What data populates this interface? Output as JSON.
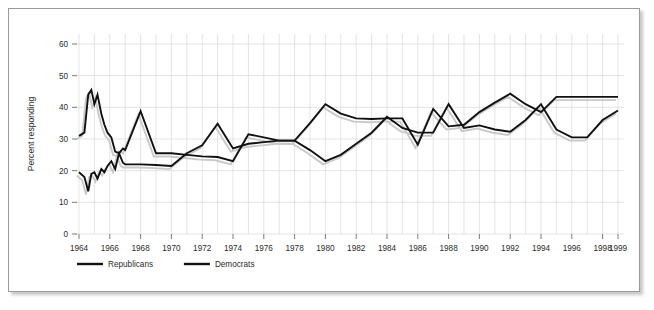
{
  "figure": {
    "frame_border_color": "#9a9a9a",
    "background_color": "#ffffff",
    "line_color": "#111111",
    "shadow_color": "#c9c9c9",
    "grid_color": "#d8d8d8"
  },
  "axis": {
    "y_title": "Percent responding",
    "y_ticks": [
      "0",
      "10",
      "20",
      "30",
      "40",
      "50",
      "60"
    ],
    "x_ticks": [
      "1964",
      "1966",
      "1968",
      "1970",
      "1972",
      "1974",
      "1976",
      "1978",
      "1980",
      "1982",
      "1984",
      "1986",
      "1988",
      "1990",
      "1992",
      "1994",
      "1996",
      "1998",
      "1999"
    ]
  },
  "legend": {
    "items": [
      {
        "label": "Republicans",
        "color": "#111111"
      },
      {
        "label": "Democrats",
        "color": "#111111"
      }
    ]
  },
  "chart_data": {
    "type": "line",
    "title": "",
    "xlabel": "",
    "ylabel": "Percent responding",
    "xlim": [
      1964,
      1999
    ],
    "ylim": [
      0,
      65
    ],
    "y_ticks": [
      0,
      10,
      20,
      30,
      40,
      50,
      60
    ],
    "x_ticks": [
      1964,
      1966,
      1968,
      1970,
      1972,
      1974,
      1976,
      1978,
      1980,
      1982,
      1984,
      1986,
      1988,
      1990,
      1992,
      1994,
      1996,
      1998,
      1999
    ],
    "grid": true,
    "legend_position": "below-axis-left",
    "series": [
      {
        "name": "Republicans",
        "color": "#111111",
        "x": [
          1964.0,
          1964.35,
          1964.6,
          1964.8,
          1965.0,
          1965.2,
          1965.45,
          1965.65,
          1965.85,
          1966.1,
          1966.35,
          1966.6,
          1966.85,
          1967.0,
          1968,
          1969,
          1970,
          1971,
          1972,
          1973,
          1974,
          1975,
          1976,
          1977,
          1978,
          1979,
          1980,
          1981,
          1982,
          1983,
          1984,
          1985,
          1986,
          1987,
          1988,
          1989,
          1990,
          1991,
          1992,
          1993,
          1994,
          1995,
          1996,
          1997,
          1998,
          1999
        ],
        "y": [
          31.0,
          32.0,
          44.0,
          45.5,
          41.0,
          44.0,
          38.0,
          34.5,
          32.0,
          30.5,
          26.0,
          25.5,
          27.0,
          26.5,
          38.8,
          25.5,
          25.5,
          25.0,
          24.5,
          24.3,
          23.0,
          31.5,
          30.5,
          29.5,
          29.5,
          35.0,
          41.0,
          38.0,
          36.5,
          36.3,
          36.5,
          36.5,
          28.2,
          39.5,
          34.0,
          34.5,
          38.5,
          41.5,
          44.3,
          41.0,
          38.5,
          43.3,
          43.3,
          43.3,
          43.3,
          43.3
        ]
      },
      {
        "name": "Democrats",
        "color": "#111111",
        "x": [
          1964.0,
          1964.35,
          1964.6,
          1964.8,
          1965.0,
          1965.2,
          1965.45,
          1965.65,
          1965.85,
          1966.1,
          1966.35,
          1966.6,
          1966.85,
          1967.0,
          1968,
          1969,
          1970,
          1971,
          1972,
          1973,
          1974,
          1975,
          1976,
          1977,
          1978,
          1979,
          1980,
          1981,
          1982,
          1983,
          1984,
          1985,
          1986,
          1987,
          1988,
          1989,
          1990,
          1991,
          1992,
          1993,
          1994,
          1995,
          1996,
          1997,
          1998,
          1999
        ],
        "y": [
          19.5,
          18.0,
          13.5,
          19.0,
          19.5,
          17.5,
          20.5,
          19.5,
          21.5,
          23.0,
          20.5,
          25.5,
          22.5,
          22.0,
          22.0,
          21.8,
          21.5,
          25.5,
          28.0,
          34.8,
          27.0,
          28.5,
          29.0,
          29.5,
          29.5,
          26.5,
          23.0,
          25.0,
          28.5,
          32.0,
          37.0,
          33.5,
          32.0,
          32.0,
          41.0,
          33.5,
          34.3,
          33.0,
          32.3,
          36.0,
          41.0,
          33.0,
          30.5,
          30.5,
          36.0,
          39.0
        ]
      }
    ]
  }
}
